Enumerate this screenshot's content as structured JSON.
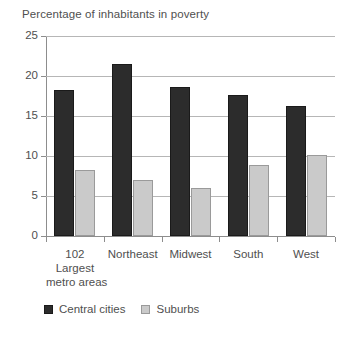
{
  "chart_data": {
    "type": "bar",
    "title": "Percentage of inhabitants in poverty",
    "xlabel": "",
    "ylabel": "",
    "ylim": [
      0,
      25
    ],
    "yticks": [
      0,
      5,
      10,
      15,
      20,
      25
    ],
    "grid": true,
    "legend_position": "bottom-left",
    "categories": [
      "102\nLargest\nmetro areas",
      "Northeast",
      "Midwest",
      "South",
      "West"
    ],
    "category_lines": [
      [
        "102",
        "Largest",
        "metro areas"
      ],
      [
        "Northeast"
      ],
      [
        "Midwest"
      ],
      [
        "South"
      ],
      [
        "West"
      ]
    ],
    "series": [
      {
        "name": "Central cities",
        "color": "#2c2c2c",
        "values": [
          18.3,
          21.5,
          18.6,
          17.6,
          16.3
        ]
      },
      {
        "name": "Suburbs",
        "color": "#cacaca",
        "values": [
          8.2,
          7.0,
          6.0,
          8.9,
          10.1
        ]
      }
    ]
  },
  "axis": {
    "y_tick_labels": [
      "0",
      "5",
      "10",
      "15",
      "20",
      "25"
    ]
  },
  "legend": {
    "items": [
      {
        "label": "Central cities",
        "swatch": "dark-square-icon"
      },
      {
        "label": "Suburbs",
        "swatch": "light-square-icon"
      }
    ]
  }
}
